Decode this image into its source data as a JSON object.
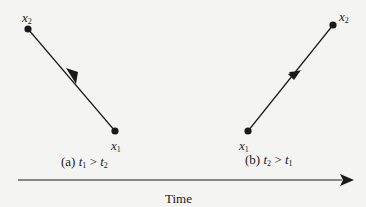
{
  "diagram": {
    "type": "worldline-direction-illustration",
    "panels": [
      {
        "id": "a",
        "caption_prefix": "(a)",
        "caption_relation": {
          "left": {
            "var": "t",
            "sub": "1"
          },
          "op": ">",
          "right": {
            "var": "t",
            "sub": "2"
          }
        },
        "points": [
          {
            "name": "x",
            "sub": "2",
            "role": "start"
          },
          {
            "name": "x",
            "sub": "1",
            "role": "end"
          }
        ],
        "arrow_direction": "from x2 (upper-left) toward x1 (lower-right)"
      },
      {
        "id": "b",
        "caption_prefix": "(b)",
        "caption_relation": {
          "left": {
            "var": "t",
            "sub": "2"
          },
          "op": ">",
          "right": {
            "var": "t",
            "sub": "1"
          }
        },
        "points": [
          {
            "name": "x",
            "sub": "1",
            "role": "start"
          },
          {
            "name": "x",
            "sub": "2",
            "role": "end"
          }
        ],
        "arrow_direction": "from x1 (lower-left) toward x2 (upper-right)"
      }
    ],
    "axis": {
      "label": "Time",
      "direction": "left-to-right"
    },
    "colors": {
      "ink": "#1a1a1a",
      "background": "#f4f4f2"
    }
  }
}
